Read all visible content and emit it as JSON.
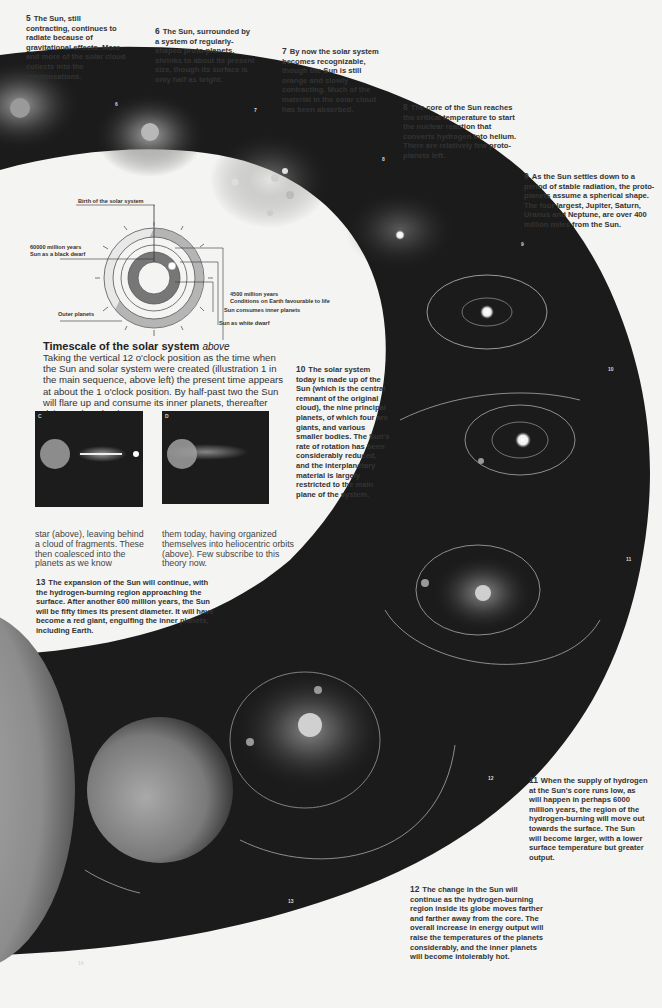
{
  "captions": [
    {
      "num": "5",
      "text": "The Sun, still contracting, continues to radiate because of gravitational effects. More and more of the solar cloud collects into the condensations."
    },
    {
      "num": "6",
      "text": "The Sun, surrounded by a system of regularly-shaped proto-planets, shrinks to about its present size, though its surface is only half as bright."
    },
    {
      "num": "7",
      "text": "By now the solar system becomes recognizable, though the Sun is still orange and slowly contracting. Much of the material in the solar cloud has been absorbed."
    },
    {
      "num": "8",
      "text": "The core of the Sun reaches the critical temperature to start the nuclear reaction that converts hydrogen into helium. There are relatively few proto-planets left."
    },
    {
      "num": "9",
      "text": "As the Sun settles down to a period of stable radiation, the proto-planets assume a spherical shape. The four largest, Jupiter, Saturn, Uranus and Neptune, are over 400 million miles from the Sun."
    },
    {
      "num": "10",
      "text": "The solar system today is made up of the Sun (which is the central remnant of the original cloud), the nine principal planets, of which four are giants, and various smaller bodies. The Sun's rate of rotation has been considerably reduced, and the interplanetary material is largely restricted to the main plane of the system."
    },
    {
      "num": "11",
      "text": "When the supply of hydrogen at the Sun's core runs low, as will happen in perhaps 6000 million years, the region of the hydrogen-burning will move out towards the surface. The Sun will become larger, with a lower surface temperature but greater output."
    },
    {
      "num": "12",
      "text": "The change in the Sun will continue as the hydrogen-burning region inside its globe moves farther and farther away from the core. The overall increase in energy output will raise the temperatures of the planets considerably, and the inner planets will become intolerably hot."
    },
    {
      "num": "13",
      "text": "The expansion of the Sun will continue, with the hydrogen-burning region approaching the surface. After another 600 million years, the Sun will be fifty times its present diameter. It will have become a red giant, engulfing the inner planets, including Earth."
    }
  ],
  "band_numbers": [
    "6",
    "7",
    "8",
    "9",
    "10",
    "11",
    "12",
    "13",
    "14"
  ],
  "timescale": {
    "title": "Timescale of the solar system",
    "title_suffix": "above",
    "body": "Taking the vertical 12 o'clock position as the time when the Sun and solar system were created (illustration 1 in the main sequence, above left) the present time appears at about the 1 o'clock position. By half-past two the Sun will flare up and consume its inner planets, thereafter dying a slow death.",
    "diagram_labels": {
      "birth": "Birth of the solar system",
      "black_dwarf_line1": "60000 million years",
      "black_dwarf_line2": "Sun as a black dwarf",
      "earth_line1": "4500 million years",
      "earth_line2": "Conditions on Earth favourable to life",
      "consumes": "Sun consumes inner planets",
      "white_dwarf": "Sun as white dwarf",
      "outer_planets": "Outer planets"
    }
  },
  "panels": [
    {
      "label": "C"
    },
    {
      "label": "D"
    }
  ],
  "panel_text": {
    "left": "star (above), leaving behind a cloud of fragments. These then coalesced into the planets as we know",
    "right": "them today, having organized themselves into heliocentric orbits (above). Few subscribe to this theory now."
  },
  "colors": {
    "page": "#f4f4f2",
    "band": "#1a1a1a",
    "text": "#333333"
  }
}
